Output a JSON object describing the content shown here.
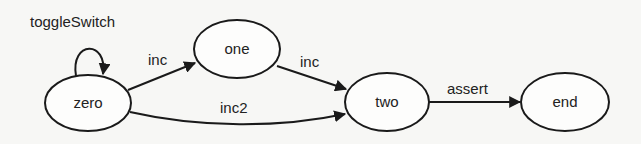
{
  "diagram": {
    "type": "state-machine",
    "nodes": [
      {
        "id": "zero",
        "label": "zero"
      },
      {
        "id": "one",
        "label": "one"
      },
      {
        "id": "two",
        "label": "two"
      },
      {
        "id": "end",
        "label": "end"
      }
    ],
    "edges": [
      {
        "from": "zero",
        "to": "zero",
        "label": "toggleSwitch"
      },
      {
        "from": "zero",
        "to": "one",
        "label": "inc"
      },
      {
        "from": "one",
        "to": "two",
        "label": "inc"
      },
      {
        "from": "zero",
        "to": "two",
        "label": "inc2"
      },
      {
        "from": "two",
        "to": "end",
        "label": "assert"
      }
    ]
  }
}
